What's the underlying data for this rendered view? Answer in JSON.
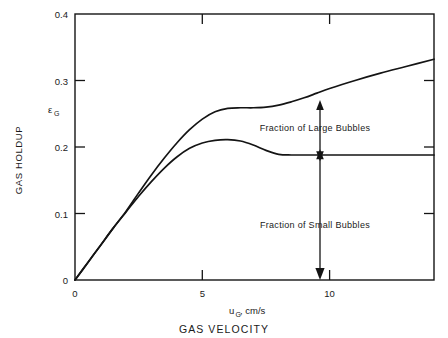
{
  "chart_data": {
    "type": "line",
    "title": "",
    "xlabel": "uG, cm/s",
    "xlabel_main": "u",
    "xlabel_sub": "G",
    "xlabel_rest": ", cm/s",
    "xlabel_caption": "GAS VELOCITY",
    "ylabel": "GAS HOLDUP",
    "ylabel_symbol_main": "ε",
    "ylabel_symbol_sub": "G",
    "xlim": [
      0,
      14.1
    ],
    "ylim": [
      0,
      0.4
    ],
    "xticks": [
      0,
      5,
      10
    ],
    "xtick_labels": [
      "0",
      "5",
      "10"
    ],
    "yticks": [
      0,
      0.1,
      0.2,
      0.3,
      0.4
    ],
    "ytick_labels": [
      "0",
      "0.1",
      "0.2",
      "0.3",
      "0.4"
    ],
    "grid": false,
    "legend": "none",
    "series": [
      {
        "name": "Total gas holdup",
        "points": [
          [
            0.0,
            0.0
          ],
          [
            0.5,
            0.026
          ],
          [
            1.0,
            0.052
          ],
          [
            1.5,
            0.078
          ],
          [
            2.0,
            0.103
          ],
          [
            2.5,
            0.131
          ],
          [
            3.0,
            0.158
          ],
          [
            3.5,
            0.183
          ],
          [
            4.0,
            0.206
          ],
          [
            4.5,
            0.226
          ],
          [
            5.0,
            0.242
          ],
          [
            5.5,
            0.253
          ],
          [
            6.0,
            0.258
          ],
          [
            6.5,
            0.259
          ],
          [
            7.0,
            0.259
          ],
          [
            7.5,
            0.26
          ],
          [
            8.0,
            0.263
          ],
          [
            8.5,
            0.268
          ],
          [
            9.0,
            0.274
          ],
          [
            9.5,
            0.281
          ],
          [
            10.0,
            0.288
          ],
          [
            11.0,
            0.3
          ],
          [
            12.0,
            0.311
          ],
          [
            13.0,
            0.321
          ],
          [
            14.1,
            0.332
          ]
        ]
      },
      {
        "name": "Small bubble holdup",
        "points": [
          [
            0.0,
            0.0
          ],
          [
            0.5,
            0.026
          ],
          [
            1.0,
            0.052
          ],
          [
            1.5,
            0.078
          ],
          [
            2.0,
            0.102
          ],
          [
            2.5,
            0.126
          ],
          [
            3.0,
            0.148
          ],
          [
            3.5,
            0.168
          ],
          [
            4.0,
            0.185
          ],
          [
            4.5,
            0.198
          ],
          [
            5.0,
            0.206
          ],
          [
            5.5,
            0.21
          ],
          [
            6.0,
            0.211
          ],
          [
            6.5,
            0.209
          ],
          [
            7.0,
            0.203
          ],
          [
            7.5,
            0.195
          ],
          [
            8.0,
            0.189
          ],
          [
            8.5,
            0.188
          ],
          [
            9.0,
            0.188
          ],
          [
            10.0,
            0.188
          ],
          [
            11.0,
            0.188
          ],
          [
            12.0,
            0.188
          ],
          [
            13.0,
            0.188
          ],
          [
            14.1,
            0.188
          ]
        ]
      }
    ],
    "annotations": [
      {
        "label": "Fraction of Large Bubbles",
        "x": 9.6,
        "from_y": 0.188,
        "to_y": 0.272
      },
      {
        "label": "Fraction of Small Bubbles",
        "x": 9.6,
        "from_y": 0.188,
        "to_y": 0.0
      }
    ]
  },
  "axis": {
    "y_tick_0": "0",
    "y_tick_1": "0.1",
    "y_tick_2": "0.2",
    "y_tick_3": "0.3",
    "y_tick_4": "0.4",
    "x_tick_0": "0",
    "x_tick_5": "5",
    "x_tick_10": "10"
  },
  "labels": {
    "y_axis_title": "GAS HOLDUP",
    "y_axis_symbol": "ε",
    "y_axis_symbol_sub": "G",
    "x_axis_var": "u",
    "x_axis_var_sub": "G",
    "x_axis_units": ", cm/s",
    "x_axis_title": "GAS VELOCITY",
    "annotation_large": "Fraction of Large Bubbles",
    "annotation_small": "Fraction of Small Bubbles"
  },
  "colors": {
    "ink": "#141414",
    "background": "#ffffff"
  }
}
